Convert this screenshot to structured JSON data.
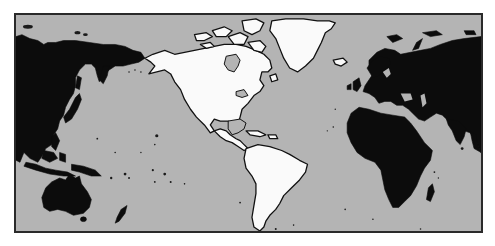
{
  "map": {
    "type": "world-map",
    "projection": "pacific-centered cylindrical",
    "highlighted_region": "Americas",
    "colors": {
      "ocean": "#b4b4b4",
      "highlighted_land": "#fafafa",
      "other_land": "#0c0c0c",
      "frame": "#2a2a2a",
      "background": "#ffffff"
    },
    "regions": [
      {
        "name": "North America",
        "highlighted": true
      },
      {
        "name": "Greenland",
        "highlighted": true
      },
      {
        "name": "Central America & Caribbean",
        "highlighted": true
      },
      {
        "name": "South America",
        "highlighted": true
      },
      {
        "name": "Eurasia",
        "highlighted": false
      },
      {
        "name": "Africa",
        "highlighted": false
      },
      {
        "name": "Australia",
        "highlighted": false
      },
      {
        "name": "Oceania",
        "highlighted": false
      }
    ]
  }
}
